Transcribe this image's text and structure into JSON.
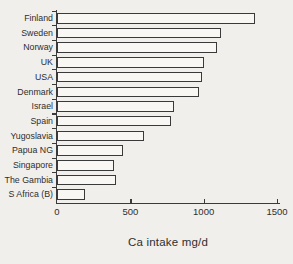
{
  "chart_data": {
    "type": "bar",
    "orientation": "horizontal",
    "title": "",
    "xlabel": "Ca intake mg/d",
    "ylabel": "",
    "categories": [
      "Finland",
      "Sweden",
      "Norway",
      "UK",
      "USA",
      "Denmark",
      "Israel",
      "Spain",
      "Yugoslavia",
      "Papua NG",
      "Singapore",
      "The Gambia",
      "S Africa (B)"
    ],
    "values": [
      1350,
      1120,
      1090,
      1000,
      990,
      970,
      800,
      780,
      590,
      450,
      390,
      400,
      190
    ],
    "x_ticks": [
      0,
      500,
      1000,
      1500
    ],
    "xlim": [
      0,
      1500
    ],
    "grid": false,
    "legend_position": "none",
    "colors": {
      "background": "#f1efec",
      "bar_fill": "#f8f7f4",
      "axis_and_outline": "#3a3a3a",
      "text": "#2e2e2e"
    }
  }
}
